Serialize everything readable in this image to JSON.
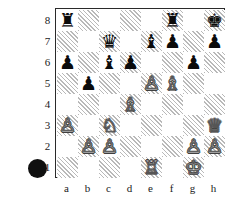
{
  "diagram": {
    "side_to_move": "black",
    "turn_indicator": "black-filled-circle",
    "orientation": "white-bottom",
    "board_size": 8,
    "files": [
      "a",
      "b",
      "c",
      "d",
      "e",
      "f",
      "g",
      "h"
    ],
    "ranks": [
      "8",
      "7",
      "6",
      "5",
      "4",
      "3",
      "2",
      "1"
    ],
    "colors": {
      "light_square": "#ffffff",
      "dark_square": "#b9b9b9",
      "border": "#2a2a2a",
      "black_piece": "#0b0b0b",
      "white_piece": "#ffffff",
      "white_piece_outline": "#3a3a3a",
      "turn_dot": "#101010",
      "label_text": "#1a1a1a"
    },
    "fen": "r4r1k/2q1bp1p/p1bp2p1/1p2PB2/3B4/P1N4Q/1PP3PP/4R1K1 b - - 0 1",
    "pieces": [
      {
        "square": "a8",
        "color": "black",
        "type": "rook",
        "glyph": "♜"
      },
      {
        "square": "f8",
        "color": "black",
        "type": "rook",
        "glyph": "♜"
      },
      {
        "square": "h8",
        "color": "black",
        "type": "king",
        "glyph": "♚"
      },
      {
        "square": "c7",
        "color": "black",
        "type": "queen",
        "glyph": "♛"
      },
      {
        "square": "e7",
        "color": "black",
        "type": "bishop",
        "glyph": "♝"
      },
      {
        "square": "f7",
        "color": "black",
        "type": "pawn",
        "glyph": "♟"
      },
      {
        "square": "h7",
        "color": "black",
        "type": "pawn",
        "glyph": "♟"
      },
      {
        "square": "a6",
        "color": "black",
        "type": "pawn",
        "glyph": "♟"
      },
      {
        "square": "c6",
        "color": "black",
        "type": "bishop",
        "glyph": "♝"
      },
      {
        "square": "d6",
        "color": "black",
        "type": "pawn",
        "glyph": "♟"
      },
      {
        "square": "g6",
        "color": "black",
        "type": "pawn",
        "glyph": "♟"
      },
      {
        "square": "b5",
        "color": "black",
        "type": "pawn",
        "glyph": "♟"
      },
      {
        "square": "e5",
        "color": "white",
        "type": "pawn",
        "glyph": "♙"
      },
      {
        "square": "f5",
        "color": "white",
        "type": "bishop",
        "glyph": "♗"
      },
      {
        "square": "d4",
        "color": "white",
        "type": "bishop",
        "glyph": "♗"
      },
      {
        "square": "a3",
        "color": "white",
        "type": "pawn",
        "glyph": "♙"
      },
      {
        "square": "c3",
        "color": "white",
        "type": "knight",
        "glyph": "♘"
      },
      {
        "square": "h3",
        "color": "white",
        "type": "queen",
        "glyph": "♕"
      },
      {
        "square": "b2",
        "color": "white",
        "type": "pawn",
        "glyph": "♙"
      },
      {
        "square": "c2",
        "color": "white",
        "type": "pawn",
        "glyph": "♙"
      },
      {
        "square": "g2",
        "color": "white",
        "type": "pawn",
        "glyph": "♙"
      },
      {
        "square": "h2",
        "color": "white",
        "type": "pawn",
        "glyph": "♙"
      },
      {
        "square": "e1",
        "color": "white",
        "type": "rook",
        "glyph": "♖"
      },
      {
        "square": "g1",
        "color": "white",
        "type": "king",
        "glyph": "♔"
      }
    ]
  }
}
